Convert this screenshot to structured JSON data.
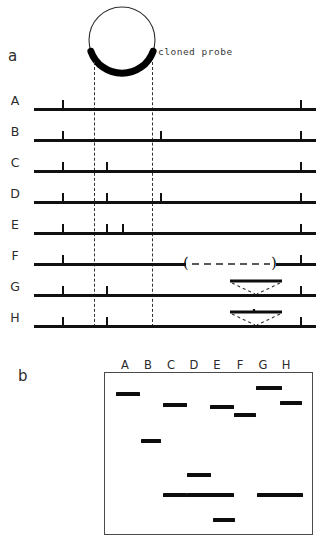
{
  "figure": {
    "panels": [
      {
        "id": "a",
        "letter": "a"
      },
      {
        "id": "b",
        "letter": "b"
      }
    ]
  },
  "panel_a": {
    "letter": "a",
    "probe_label": "cloned probe",
    "plasmid": {
      "circle_cx": 42,
      "circle_cy": 40,
      "circle_r": 33,
      "probe_arc_start_deg": 200,
      "probe_arc_end_deg": 340,
      "probe_arc_color": "#000000"
    },
    "guides": [
      {
        "name": "probe-left-guide",
        "x": 94,
        "y": 62,
        "height": 265
      },
      {
        "name": "probe-right-guide",
        "x": 152,
        "y": 62,
        "height": 265
      }
    ],
    "maps": [
      {
        "label": "A",
        "y": 100,
        "line_start": 34,
        "line_end": 316,
        "ticks": [
          62,
          300
        ],
        "deletion": null,
        "insertion": null
      },
      {
        "label": "B",
        "y": 131,
        "line_start": 34,
        "line_end": 316,
        "ticks": [
          62,
          160,
          300
        ],
        "deletion": null,
        "insertion": null
      },
      {
        "label": "C",
        "y": 162,
        "line_start": 34,
        "line_end": 316,
        "ticks": [
          62,
          106,
          300
        ],
        "deletion": null,
        "insertion": null
      },
      {
        "label": "D",
        "y": 193,
        "line_start": 34,
        "line_end": 316,
        "ticks": [
          62,
          106,
          160,
          300
        ],
        "deletion": null,
        "insertion": null
      },
      {
        "label": "E",
        "y": 224,
        "line_start": 34,
        "line_end": 316,
        "ticks": [
          62,
          106,
          122,
          300
        ],
        "deletion": null,
        "insertion": null
      },
      {
        "label": "F",
        "y": 255,
        "line_start": 34,
        "line_end": 316,
        "ticks": [
          62,
          300
        ],
        "deletion": {
          "start": 186,
          "end": 276
        },
        "insertion": null
      },
      {
        "label": "G",
        "y": 286,
        "line_start": 34,
        "line_end": 316,
        "ticks": [
          62,
          106,
          300
        ],
        "deletion": null,
        "insertion": {
          "base_start": 232,
          "base_end": 276,
          "loop_top_offset": -14,
          "loop_tick": null
        }
      },
      {
        "label": "H",
        "y": 317,
        "line_start": 34,
        "line_end": 316,
        "ticks": [
          62,
          106,
          300
        ],
        "deletion": null,
        "insertion": {
          "base_start": 232,
          "base_end": 276,
          "loop_top_offset": -14,
          "loop_tick": 254
        }
      }
    ]
  },
  "panel_b": {
    "letter": "b",
    "box": {
      "x": 104,
      "y": 372,
      "width": 207,
      "height": 161
    },
    "lane_labels": [
      "A",
      "B",
      "C",
      "D",
      "E",
      "F",
      "G",
      "H"
    ],
    "lane_x": [
      125,
      148,
      171,
      194,
      217,
      240,
      263,
      286
    ],
    "label_y": 358,
    "bands": [
      {
        "lane": "A",
        "x": 115,
        "y": 391,
        "width": 24
      },
      {
        "lane": "B",
        "x": 140,
        "y": 438,
        "width": 20
      },
      {
        "lane": "C",
        "x": 162,
        "y": 402,
        "width": 24
      },
      {
        "lane": "C",
        "x": 162,
        "y": 492,
        "width": 24
      },
      {
        "lane": "D",
        "x": 186,
        "y": 472,
        "width": 24
      },
      {
        "lane": "D",
        "x": 186,
        "y": 492,
        "width": 24
      },
      {
        "lane": "E",
        "x": 209,
        "y": 404,
        "width": 24
      },
      {
        "lane": "E",
        "x": 209,
        "y": 492,
        "width": 24
      },
      {
        "lane": "E",
        "x": 212,
        "y": 517,
        "width": 22
      },
      {
        "lane": "F",
        "x": 233,
        "y": 412,
        "width": 22
      },
      {
        "lane": "G",
        "x": 255,
        "y": 385,
        "width": 26
      },
      {
        "lane": "G",
        "x": 256,
        "y": 492,
        "width": 24
      },
      {
        "lane": "H",
        "x": 279,
        "y": 400,
        "width": 22
      },
      {
        "lane": "H",
        "x": 278,
        "y": 492,
        "width": 24
      }
    ]
  },
  "colors": {
    "ink": "#111111",
    "line": "#0d0d0d",
    "box_border": "#4a4a4a",
    "text": "#2b2b2b"
  }
}
